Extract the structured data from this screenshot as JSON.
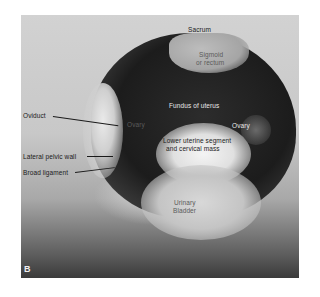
{
  "figure": {
    "panel_letter": "B",
    "labels": {
      "sacrum": "Sacrum",
      "sigmoid_line1": "Sigmoid",
      "sigmoid_line2": "or rectum",
      "fundus": "Fundus of uterus",
      "ovary_left": "Ovary",
      "ovary_right": "Ovary",
      "lower_uterine_line1": "Lower uterine segment",
      "lower_uterine_line2": "and cervical mass",
      "bladder_line1": "Urinary",
      "bladder_line2": "Bladder",
      "oviduct": "Oviduct",
      "lateral_pelvic_wall": "Lateral pelvic wall",
      "broad_ligament": "Broad ligament"
    }
  }
}
